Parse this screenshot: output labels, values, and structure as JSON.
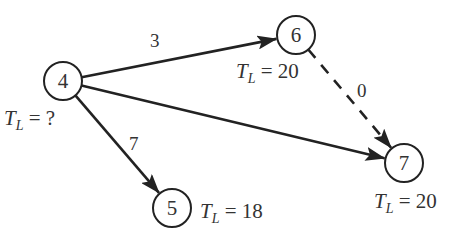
{
  "diagram": {
    "type": "activity-network",
    "nodes": [
      {
        "id": "4",
        "label": "4",
        "cx": 63,
        "cy": 81,
        "tl_value": "?",
        "tl_x": 4,
        "tl_y": 125
      },
      {
        "id": "6",
        "label": "6",
        "cx": 296,
        "cy": 35,
        "tl_value": "20",
        "tl_x": 236,
        "tl_y": 78
      },
      {
        "id": "7",
        "label": "7",
        "cx": 404,
        "cy": 163,
        "tl_value": "20",
        "tl_x": 374,
        "tl_y": 208
      },
      {
        "id": "5",
        "label": "5",
        "cx": 172,
        "cy": 208,
        "tl_value": "18",
        "tl_x": 200,
        "tl_y": 218
      }
    ],
    "edges": [
      {
        "from": "4",
        "to": "6",
        "label": "3",
        "style": "solid",
        "label_x": 150,
        "label_y": 47
      },
      {
        "from": "4",
        "to": "7",
        "label": "",
        "style": "solid"
      },
      {
        "from": "4",
        "to": "5",
        "label": "7",
        "style": "solid",
        "label_x": 129,
        "label_y": 150
      },
      {
        "from": "6",
        "to": "7",
        "label": "0",
        "style": "dashed",
        "label_x": 357,
        "label_y": 97
      }
    ],
    "tl_symbol": "T",
    "tl_subscript": "L",
    "tl_equals": " = ",
    "colors": {
      "stroke": "#222222",
      "text": "#333333",
      "background": "#ffffff"
    }
  }
}
